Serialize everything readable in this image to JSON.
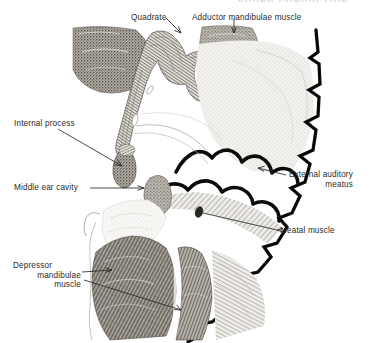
{
  "figure": {
    "title_fragment": "SOUND CONDUCTION",
    "background_color": "#ffffff",
    "ink_color": "#2b2b2b",
    "labels": [
      {
        "name": "quadrate",
        "text": "Quadrate",
        "lines": [
          "Quadrate"
        ],
        "x": 131,
        "y": 13,
        "align": "left"
      },
      {
        "name": "adductor-mandibulae-muscle",
        "text": "Adductor mandibulae muscle",
        "lines": [
          "Adductor mandibulae muscle"
        ],
        "x": 192,
        "y": 13,
        "align": "left"
      },
      {
        "name": "internal-process",
        "text": "Internal process",
        "lines": [
          "Internal process"
        ],
        "x": 14,
        "y": 119,
        "align": "left"
      },
      {
        "name": "middle-ear-cavity",
        "text": "Middle ear cavity",
        "lines": [
          "Middle ear cavity"
        ],
        "x": 14,
        "y": 183,
        "align": "left"
      },
      {
        "name": "external-auditory-meatus",
        "text": "External auditory meatus",
        "lines": [
          "External auditory",
          "meatus"
        ],
        "x": 289,
        "y": 170,
        "align": "left"
      },
      {
        "name": "meatal-muscle",
        "text": "Meatal muscle",
        "lines": [
          "Meatal  muscle"
        ],
        "x": 280,
        "y": 226,
        "align": "left"
      },
      {
        "name": "depressor-mandibulae-muscle",
        "text": "Depressor mandibulae muscle",
        "lines": [
          "Depressor",
          "mandibulae",
          "muscle"
        ],
        "x": 13,
        "y": 261,
        "align": "left"
      }
    ],
    "structures": [
      "quadrate-bone",
      "adductor-mandibulae-muscle-mass",
      "internal-process",
      "middle-ear-cavity",
      "tympanic-membrane",
      "external-auditory-meatus",
      "meatal-muscle",
      "depressor-mandibulae-muscle-mass",
      "skin-epidermis-border"
    ]
  }
}
